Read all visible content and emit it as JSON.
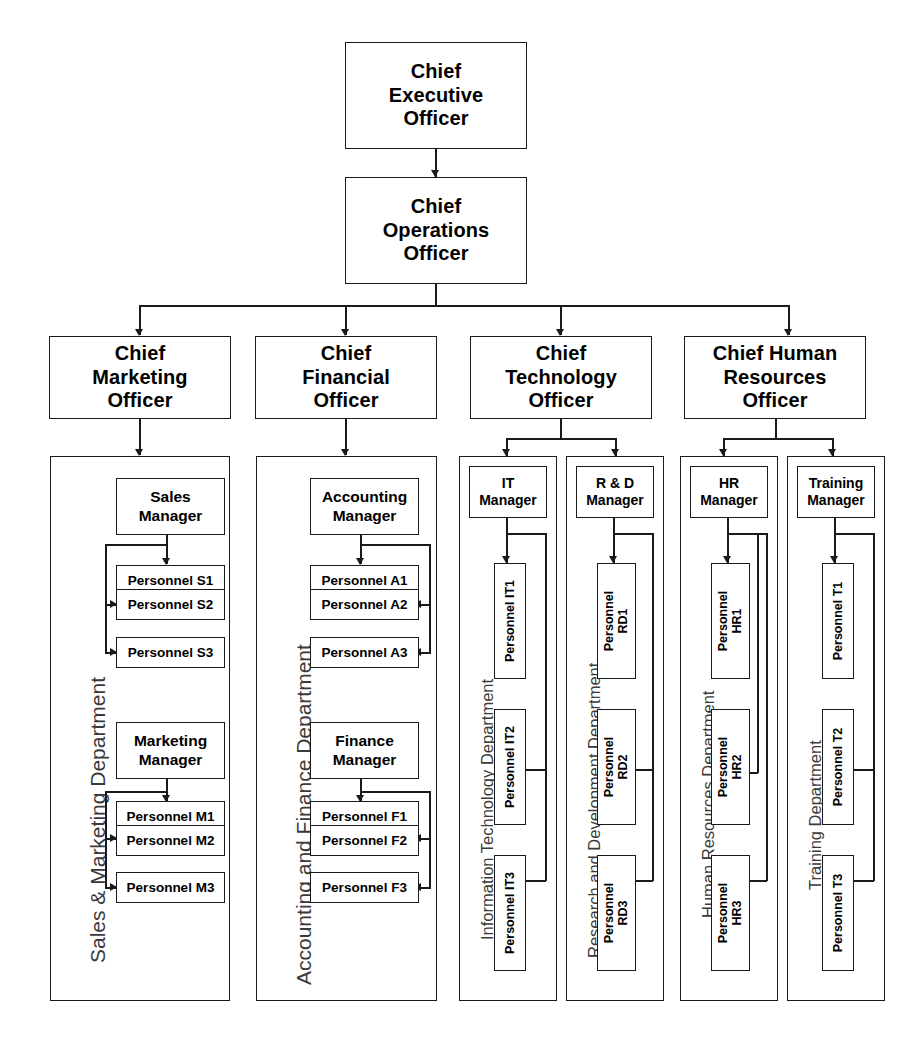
{
  "chart_title": "Corporate Organizational Chart",
  "executives": {
    "ceo": "Chief\nExecutive\nOfficer",
    "ceo_line1": "Chief",
    "ceo_line2": "Executive",
    "ceo_line3": "Officer",
    "coo_line1": "Chief",
    "coo_line2": "Operations",
    "coo_line3": "Officer",
    "cmo_line1": "Chief",
    "cmo_line2": "Marketing",
    "cmo_line3": "Officer",
    "cfo_line1": "Chief",
    "cfo_line2": "Financial",
    "cfo_line3": "Officer",
    "cto_line1": "Chief",
    "cto_line2": "Technology",
    "cto_line3": "Officer",
    "chro_line1": "Chief Human",
    "chro_line2": "Resources",
    "chro_line3": "Officer"
  },
  "departments": [
    {
      "id": "sales-marketing",
      "label": "Sales & Marketing Department",
      "managers": [
        {
          "id": "sales-manager",
          "line1": "Sales",
          "line2": "Manager",
          "personnel": [
            "Personnel S1",
            "Personnel S2",
            "Personnel S3"
          ]
        },
        {
          "id": "marketing-manager",
          "line1": "Marketing",
          "line2": "Manager",
          "personnel": [
            "Personnel M1",
            "Personnel M2",
            "Personnel M3"
          ]
        }
      ]
    },
    {
      "id": "accounting-finance",
      "label": "Accounting and Finance Department",
      "managers": [
        {
          "id": "accounting-manager",
          "line1": "Accounting",
          "line2": "Manager",
          "personnel": [
            "Personnel A1",
            "Personnel A2",
            "Personnel A3"
          ]
        },
        {
          "id": "finance-manager",
          "line1": "Finance",
          "line2": "Manager",
          "personnel": [
            "Personnel F1",
            "Personnel F2",
            "Personnel F3"
          ]
        }
      ]
    },
    {
      "id": "information-technology",
      "label": "Information Technology Department",
      "managers": [
        {
          "id": "it-manager",
          "line1": "IT",
          "line2": "Manager",
          "personnel": [
            "Personnel IT1",
            "Personnel IT2",
            "Personnel IT3"
          ]
        }
      ]
    },
    {
      "id": "research-development",
      "label": "Research and Development Department",
      "managers": [
        {
          "id": "rd-manager",
          "line1": "R & D",
          "line2": "Manager",
          "personnel": [
            "Personnel\nRD1",
            "Personnel\nRD2",
            "Personnel\nRD3"
          ]
        }
      ]
    },
    {
      "id": "human-resources",
      "label": "Human Resources Department",
      "managers": [
        {
          "id": "hr-manager",
          "line1": "HR",
          "line2": "Manager",
          "personnel": [
            "Personnel\nHR1",
            "Personnel\nHR2",
            "Personnel\nHR3"
          ]
        }
      ]
    },
    {
      "id": "training",
      "label": "Training Department",
      "managers": [
        {
          "id": "training-manager",
          "line1": "Training",
          "line2": "Manager",
          "personnel": [
            "Personnel T1",
            "Personnel T2",
            "Personnel T3"
          ]
        }
      ]
    }
  ],
  "dept_labels": {
    "sales_marketing": "Sales & Marketing Department",
    "accounting_finance": "Accounting and Finance Department",
    "information_technology": "Information Technology Department",
    "research_development": "Research and Development Department",
    "human_resources": "Human Resources Department",
    "training": "Training Department"
  },
  "managers": {
    "sales_1": "Sales",
    "sales_2": "Manager",
    "marketing_1": "Marketing",
    "marketing_2": "Manager",
    "accounting_1": "Accounting",
    "accounting_2": "Manager",
    "finance_1": "Finance",
    "finance_2": "Manager",
    "it_1": "IT",
    "it_2": "Manager",
    "rd_1": "R & D",
    "rd_2": "Manager",
    "hr_1": "HR",
    "hr_2": "Manager",
    "training_1": "Training",
    "training_2": "Manager"
  },
  "personnel": {
    "s1": "Personnel S1",
    "s2": "Personnel S2",
    "s3": "Personnel S3",
    "m1": "Personnel M1",
    "m2": "Personnel M2",
    "m3": "Personnel M3",
    "a1": "Personnel A1",
    "a2": "Personnel A2",
    "a3": "Personnel A3",
    "f1": "Personnel F1",
    "f2": "Personnel F2",
    "f3": "Personnel F3",
    "it1": "Personnel IT1",
    "it2": "Personnel IT2",
    "it3": "Personnel IT3",
    "rd1_a": "Personnel",
    "rd1_b": "RD1",
    "rd2_a": "Personnel",
    "rd2_b": "RD2",
    "rd3_a": "Personnel",
    "rd3_b": "RD3",
    "hr1_a": "Personnel",
    "hr1_b": "HR1",
    "hr2_a": "Personnel",
    "hr2_b": "HR2",
    "hr3_a": "Personnel",
    "hr3_b": "HR3",
    "t1": "Personnel T1",
    "t2": "Personnel T2",
    "t3": "Personnel T3"
  },
  "colors": {
    "line": "#1a1a1a",
    "background": "#ffffff",
    "dept_label": "#3a3a3a"
  }
}
